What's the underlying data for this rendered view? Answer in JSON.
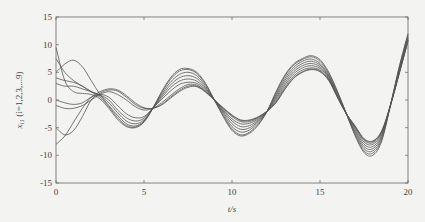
{
  "chart_data": {
    "type": "line",
    "title": "",
    "xlabel": "t/s",
    "ylabel": "x_i1 (i=1,2,3,...9)",
    "xlim": [
      0,
      20
    ],
    "ylim": [
      -15,
      15
    ],
    "xticks": [
      0,
      5,
      10,
      15,
      20
    ],
    "yticks": [
      15,
      10,
      5,
      0,
      -5,
      -10,
      -15
    ],
    "grid": false,
    "legend": "none",
    "line_color": "#555555",
    "x": [
      0,
      0.5,
      1,
      1.5,
      2,
      2.5,
      3,
      3.5,
      4,
      4.5,
      5,
      5.5,
      6,
      6.5,
      7,
      7.5,
      8,
      8.5,
      9,
      9.5,
      10,
      10.5,
      11,
      11.5,
      12,
      12.5,
      13,
      13.5,
      14,
      14.5,
      15,
      15.5,
      16,
      16.5,
      17,
      17.5,
      18,
      18.5,
      19,
      19.5,
      20
    ],
    "series": [
      {
        "name": "x_11",
        "values": [
          9.5,
          3.5,
          1.5,
          1.2,
          1.0,
          0.2,
          -1.5,
          -3.5,
          -4.8,
          -5.0,
          -4.0,
          -1.5,
          1.5,
          4.0,
          5.5,
          5.7,
          5.0,
          3.0,
          0.0,
          -3.0,
          -5.5,
          -6.5,
          -6.0,
          -4.5,
          -2.0,
          1.5,
          4.5,
          6.5,
          7.5,
          8.0,
          7.3,
          5.0,
          1.5,
          -2.5,
          -6.5,
          -9.5,
          -10.0,
          -7.5,
          -1.0,
          6.0,
          12.0
        ]
      },
      {
        "name": "x_21",
        "values": [
          7.5,
          5.0,
          3.5,
          2.5,
          1.5,
          0.5,
          -1.2,
          -3.2,
          -4.6,
          -4.9,
          -3.9,
          -1.5,
          1.3,
          3.7,
          5.2,
          5.5,
          4.8,
          2.8,
          0.0,
          -2.8,
          -5.2,
          -6.3,
          -5.8,
          -4.3,
          -2.0,
          1.3,
          4.3,
          6.3,
          7.3,
          7.8,
          7.0,
          4.8,
          1.4,
          -2.5,
          -6.3,
          -9.2,
          -9.6,
          -7.2,
          -1.0,
          5.8,
          11.8
        ]
      },
      {
        "name": "x_31",
        "values": [
          5.0,
          6.5,
          7.2,
          6.0,
          3.5,
          1.0,
          -1.0,
          -2.8,
          -4.3,
          -4.7,
          -3.8,
          -1.5,
          1.0,
          3.2,
          4.6,
          5.0,
          4.4,
          2.5,
          0.0,
          -2.5,
          -4.8,
          -5.8,
          -5.4,
          -4.0,
          -2.0,
          1.0,
          3.9,
          5.9,
          7.0,
          7.4,
          6.6,
          4.5,
          1.2,
          -2.5,
          -6.0,
          -8.8,
          -9.2,
          -6.9,
          -1.0,
          5.6,
          11.5
        ]
      },
      {
        "name": "x_41",
        "values": [
          4.0,
          3.5,
          3.2,
          2.5,
          1.5,
          0.8,
          -0.5,
          -2.3,
          -3.8,
          -4.3,
          -3.6,
          -1.5,
          0.7,
          2.7,
          4.0,
          4.4,
          3.9,
          2.2,
          0.0,
          -2.2,
          -4.3,
          -5.3,
          -5.0,
          -3.8,
          -2.0,
          0.7,
          3.5,
          5.5,
          6.6,
          7.0,
          6.3,
          4.3,
          1.0,
          -2.5,
          -5.7,
          -8.4,
          -8.8,
          -6.6,
          -1.0,
          5.4,
          11.3
        ]
      },
      {
        "name": "x_51",
        "values": [
          3.0,
          2.5,
          2.5,
          2.0,
          1.5,
          0.9,
          0.0,
          -1.8,
          -3.2,
          -3.8,
          -3.3,
          -1.5,
          0.4,
          2.2,
          3.4,
          3.8,
          3.4,
          2.0,
          0.0,
          -2.0,
          -3.8,
          -4.8,
          -4.6,
          -3.6,
          -2.0,
          0.4,
          3.1,
          5.1,
          6.2,
          6.6,
          6.0,
          4.1,
          0.8,
          -2.5,
          -5.4,
          -8.0,
          -8.4,
          -6.3,
          -1.0,
          5.2,
          11.1
        ]
      },
      {
        "name": "x_61",
        "values": [
          0.0,
          -0.5,
          -0.8,
          -0.5,
          0.5,
          1.0,
          0.5,
          -1.0,
          -2.5,
          -3.2,
          -3.0,
          -1.5,
          0.1,
          1.6,
          2.8,
          3.2,
          3.0,
          1.8,
          0.0,
          -1.8,
          -3.4,
          -4.3,
          -4.2,
          -3.4,
          -2.0,
          0.1,
          2.7,
          4.7,
          5.8,
          6.2,
          5.7,
          3.9,
          0.6,
          -2.5,
          -5.1,
          -7.6,
          -8.0,
          -6.0,
          -1.0,
          5.0,
          10.9
        ]
      },
      {
        "name": "x_71",
        "values": [
          -1.0,
          -1.5,
          -1.5,
          -1.0,
          0.0,
          1.0,
          1.5,
          1.0,
          0.0,
          -1.2,
          -1.8,
          -1.5,
          -0.5,
          0.8,
          2.0,
          2.8,
          2.7,
          1.6,
          0.0,
          -1.6,
          -3.0,
          -3.9,
          -3.9,
          -3.2,
          -2.0,
          -0.2,
          2.3,
          4.3,
          5.4,
          5.8,
          5.4,
          3.7,
          0.5,
          -2.5,
          -4.9,
          -7.3,
          -7.7,
          -5.8,
          -1.0,
          4.9,
          10.8
        ]
      },
      {
        "name": "x_81",
        "values": [
          -5.0,
          -6.3,
          -5.5,
          -3.0,
          0.0,
          1.2,
          1.8,
          1.6,
          0.5,
          -0.8,
          -1.5,
          -1.5,
          -0.8,
          0.5,
          1.7,
          2.5,
          2.5,
          1.5,
          0.0,
          -1.5,
          -2.8,
          -3.7,
          -3.7,
          -3.1,
          -2.0,
          -0.4,
          2.0,
          4.0,
          5.1,
          5.6,
          5.2,
          3.6,
          0.5,
          -2.5,
          -4.8,
          -7.1,
          -7.5,
          -5.7,
          -1.0,
          4.8,
          10.7
        ]
      },
      {
        "name": "x_91",
        "values": [
          -8.0,
          -6.5,
          -4.0,
          -1.5,
          0.5,
          1.5,
          2.0,
          1.8,
          0.8,
          -0.5,
          -1.4,
          -1.5,
          -0.9,
          0.3,
          1.5,
          2.3,
          2.4,
          1.4,
          0.0,
          -1.4,
          -2.7,
          -3.6,
          -3.6,
          -3.0,
          -2.0,
          -0.5,
          1.9,
          3.9,
          5.0,
          5.5,
          5.1,
          3.5,
          0.4,
          -2.5,
          -4.7,
          -7.0,
          -7.4,
          -5.6,
          -1.0,
          4.7,
          10.6
        ]
      }
    ]
  },
  "frame": {
    "left": 56,
    "top": 17,
    "right": 408,
    "bottom": 183
  }
}
